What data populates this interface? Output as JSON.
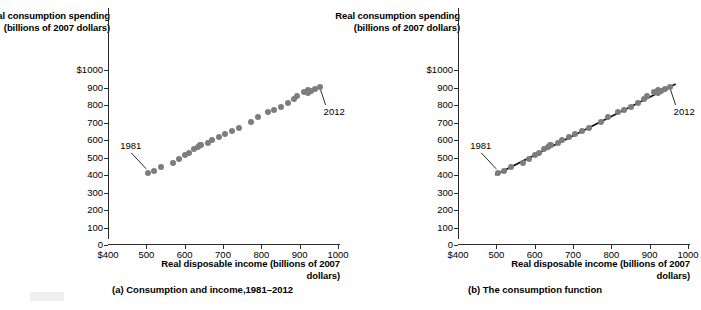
{
  "figure": {
    "background_color": "#ffffff",
    "dot_color": "#7d7d7d",
    "axis_color": "#2b2b2b",
    "line_color": "#111111"
  },
  "panels": [
    {
      "id": "a",
      "caption": "(a) Consumption and income,1981–2012",
      "yaxis_title": "Real consumption spending (billions of 2007 dollars)",
      "xaxis_title": "Real disposable income (billions of 2007 dollars)",
      "start_label": "1981",
      "end_label": "2012",
      "has_fit_line": false
    },
    {
      "id": "b",
      "caption": "(b) The consumption function",
      "yaxis_title": "Real consumption spending (billions of 2007 dollars)",
      "xaxis_title": "Real disposable income (billions of 2007 dollars)",
      "start_label": "1981",
      "end_label": "2012",
      "has_fit_line": true
    }
  ],
  "chart_data": [
    {
      "type": "scatter",
      "title": "(a) Consumption and income,1981–2012",
      "xlabel": "Real disposable income (billions of 2007 dollars)",
      "ylabel": "Real consumption spending (billions of 2007 dollars)",
      "xlim": [
        400,
        1000
      ],
      "ylim": [
        0,
        1000
      ],
      "xticks": [
        400,
        500,
        600,
        700,
        800,
        900,
        1000
      ],
      "xtick_labels": [
        "$400",
        "500",
        "600",
        "700",
        "800",
        "900",
        "1000"
      ],
      "yticks": [
        0,
        100,
        200,
        300,
        400,
        500,
        600,
        700,
        800,
        900,
        1000
      ],
      "ytick_labels": [
        "0",
        "100",
        "200",
        "300",
        "400",
        "500",
        "600",
        "700",
        "800",
        "900",
        "1000"
      ],
      "ytick_top_label": "$1000",
      "grid": false,
      "legend": false,
      "annotations": [
        {
          "text": "1981",
          "point_index": 0,
          "position": "above-left",
          "leader_line": true
        },
        {
          "text": "2012",
          "point_index": 31,
          "position": "below-right",
          "leader_line": true
        }
      ],
      "series": [
        {
          "name": "Consumption vs disposable income, 1981-2012",
          "points": [
            {
              "year": 1981,
              "x": 505,
              "y": 412
            },
            {
              "year": 1982,
              "x": 520,
              "y": 423
            },
            {
              "year": 1983,
              "x": 537,
              "y": 447
            },
            {
              "year": 1984,
              "x": 570,
              "y": 470
            },
            {
              "year": 1985,
              "x": 585,
              "y": 493
            },
            {
              "year": 1986,
              "x": 600,
              "y": 514
            },
            {
              "year": 1987,
              "x": 610,
              "y": 527
            },
            {
              "year": 1988,
              "x": 625,
              "y": 548
            },
            {
              "year": 1989,
              "x": 634,
              "y": 561
            },
            {
              "year": 1990,
              "x": 640,
              "y": 570
            },
            {
              "year": 1991,
              "x": 642,
              "y": 572
            },
            {
              "year": 1992,
              "x": 660,
              "y": 585
            },
            {
              "year": 1993,
              "x": 672,
              "y": 600
            },
            {
              "year": 1994,
              "x": 690,
              "y": 619
            },
            {
              "year": 1995,
              "x": 706,
              "y": 633
            },
            {
              "year": 1996,
              "x": 723,
              "y": 653
            },
            {
              "year": 1997,
              "x": 741,
              "y": 671
            },
            {
              "year": 1998,
              "x": 772,
              "y": 703
            },
            {
              "year": 1999,
              "x": 790,
              "y": 732
            },
            {
              "year": 2000,
              "x": 818,
              "y": 760
            },
            {
              "year": 2001,
              "x": 832,
              "y": 772
            },
            {
              "year": 2002,
              "x": 851,
              "y": 789
            },
            {
              "year": 2003,
              "x": 869,
              "y": 810
            },
            {
              "year": 2004,
              "x": 886,
              "y": 833
            },
            {
              "year": 2005,
              "x": 893,
              "y": 852
            },
            {
              "year": 2006,
              "x": 910,
              "y": 872
            },
            {
              "year": 2007,
              "x": 921,
              "y": 884
            },
            {
              "year": 2008,
              "x": 924,
              "y": 881
            },
            {
              "year": 2009,
              "x": 921,
              "y": 866
            },
            {
              "year": 2010,
              "x": 930,
              "y": 879
            },
            {
              "year": 2011,
              "x": 941,
              "y": 891
            },
            {
              "year": 2012,
              "x": 952,
              "y": 903
            }
          ]
        }
      ]
    },
    {
      "type": "scatter",
      "title": "(b) The consumption function",
      "xlabel": "Real disposable income (billions of 2007 dollars)",
      "ylabel": "Real consumption spending (billions of 2007 dollars)",
      "xlim": [
        400,
        1000
      ],
      "ylim": [
        0,
        1000
      ],
      "xticks": [
        400,
        500,
        600,
        700,
        800,
        900,
        1000
      ],
      "xtick_labels": [
        "$400",
        "500",
        "600",
        "700",
        "800",
        "900",
        "1000"
      ],
      "yticks": [
        0,
        100,
        200,
        300,
        400,
        500,
        600,
        700,
        800,
        900,
        1000
      ],
      "ytick_labels": [
        "0",
        "100",
        "200",
        "300",
        "400",
        "500",
        "600",
        "700",
        "800",
        "900",
        "1000"
      ],
      "ytick_top_label": "$1000",
      "grid": false,
      "legend": false,
      "annotations": [
        {
          "text": "1981",
          "point_index": 0,
          "position": "above-left",
          "leader_line": true
        },
        {
          "text": "2012",
          "point_index": 31,
          "position": "below-right",
          "leader_line": true
        }
      ],
      "fit_line": {
        "name": "consumption function",
        "x_start": 497,
        "y_start": 400,
        "x_end": 968,
        "y_end": 920
      },
      "series": [
        {
          "name": "Consumption vs disposable income, 1981-2012",
          "points": [
            {
              "year": 1981,
              "x": 505,
              "y": 412
            },
            {
              "year": 1982,
              "x": 520,
              "y": 423
            },
            {
              "year": 1983,
              "x": 537,
              "y": 447
            },
            {
              "year": 1984,
              "x": 570,
              "y": 470
            },
            {
              "year": 1985,
              "x": 585,
              "y": 493
            },
            {
              "year": 1986,
              "x": 600,
              "y": 514
            },
            {
              "year": 1987,
              "x": 610,
              "y": 527
            },
            {
              "year": 1988,
              "x": 625,
              "y": 548
            },
            {
              "year": 1989,
              "x": 634,
              "y": 561
            },
            {
              "year": 1990,
              "x": 640,
              "y": 570
            },
            {
              "year": 1991,
              "x": 642,
              "y": 572
            },
            {
              "year": 1992,
              "x": 660,
              "y": 585
            },
            {
              "year": 1993,
              "x": 672,
              "y": 600
            },
            {
              "year": 1994,
              "x": 690,
              "y": 619
            },
            {
              "year": 1995,
              "x": 706,
              "y": 633
            },
            {
              "year": 1996,
              "x": 723,
              "y": 653
            },
            {
              "year": 1997,
              "x": 741,
              "y": 671
            },
            {
              "year": 1998,
              "x": 772,
              "y": 703
            },
            {
              "year": 1999,
              "x": 790,
              "y": 732
            },
            {
              "year": 2000,
              "x": 818,
              "y": 760
            },
            {
              "year": 2001,
              "x": 832,
              "y": 772
            },
            {
              "year": 2002,
              "x": 851,
              "y": 789
            },
            {
              "year": 2003,
              "x": 869,
              "y": 810
            },
            {
              "year": 2004,
              "x": 886,
              "y": 833
            },
            {
              "year": 2005,
              "x": 893,
              "y": 852
            },
            {
              "year": 2006,
              "x": 910,
              "y": 872
            },
            {
              "year": 2007,
              "x": 921,
              "y": 884
            },
            {
              "year": 2008,
              "x": 924,
              "y": 881
            },
            {
              "year": 2009,
              "x": 921,
              "y": 866
            },
            {
              "year": 2010,
              "x": 930,
              "y": 879
            },
            {
              "year": 2011,
              "x": 941,
              "y": 891
            },
            {
              "year": 2012,
              "x": 952,
              "y": 903
            }
          ]
        }
      ]
    }
  ]
}
